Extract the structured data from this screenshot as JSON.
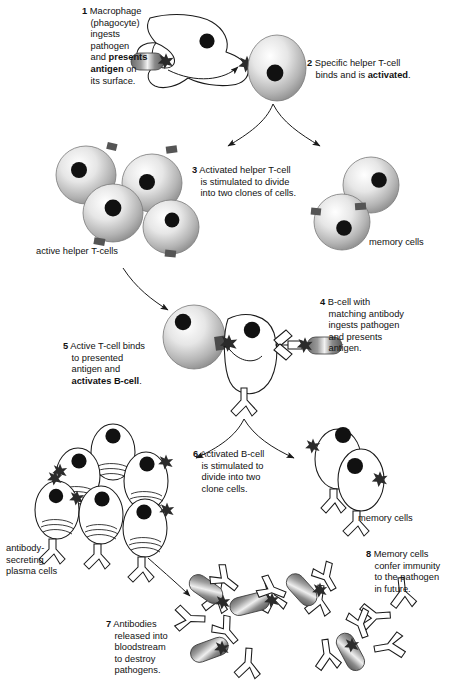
{
  "diagram": {
    "background": "#ffffff",
    "ink": "#1a1a1a"
  },
  "steps": [
    {
      "number": "1",
      "lines": [
        "Macrophage",
        "(phagocyte)",
        "ingests",
        "pathogen",
        "and presents",
        "antigen on",
        "its surface."
      ],
      "bold_words": [
        "presents",
        "antigen"
      ]
    },
    {
      "number": "2",
      "lines": [
        "Specific helper T-cell",
        "binds and is activated."
      ],
      "bold_words": [
        "activated"
      ]
    },
    {
      "number": "3",
      "lines": [
        "Activated helper T-cell",
        "is stimulated to divide",
        "into two clones of cells."
      ],
      "bold_words": []
    },
    {
      "number": "4",
      "lines": [
        "B-cell with",
        "matching antibody",
        "ingests pathogen",
        "and presents",
        "antigen."
      ],
      "bold_words": []
    },
    {
      "number": "5",
      "lines": [
        "Active T-cell binds",
        "to presented",
        "antigen and",
        "activates B-cell."
      ],
      "bold_words": [
        "activates B-cell"
      ]
    },
    {
      "number": "6",
      "lines": [
        "Activated B-cell",
        "is stimulated to",
        "divide into two",
        "clone cells."
      ],
      "bold_words": []
    },
    {
      "number": "7",
      "lines": [
        "Antibodies",
        "released into",
        "bloodstream",
        "to destroy",
        "pathogens."
      ],
      "bold_words": []
    },
    {
      "number": "8",
      "lines": [
        "Memory cells",
        "confer immunity",
        "to the pathogen",
        "in future."
      ],
      "bold_words": []
    }
  ],
  "labels": {
    "active_helper_t_cells": "active helper T-cells",
    "memory_cells_t": "memory cells",
    "memory_cells_b": "memory cells",
    "plasma_cells": [
      "antibody-",
      "secreting",
      "plasma cells"
    ]
  },
  "legend_parts": {
    "macrophage": "macrophage",
    "pathogen": "pathogen",
    "antigen": "antigen-star",
    "nucleus": "nucleus",
    "antibody": "antibody",
    "receptor": "t-cell-receptor"
  }
}
